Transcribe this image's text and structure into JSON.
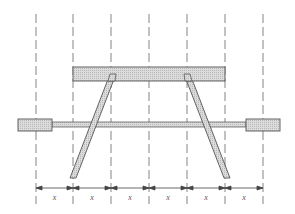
{
  "diagram": {
    "type": "mechanical-linkage",
    "colors": {
      "line": "#555555",
      "dashed": "#777777",
      "hatch_fill": "#d6d6d6",
      "background": "#ffffff"
    },
    "grid_lines_x": [
      36,
      73,
      111,
      149,
      187,
      225,
      263
    ],
    "dimension_label": "x",
    "dimensions": [
      {
        "label": "x"
      },
      {
        "label": "x"
      },
      {
        "label": "x"
      },
      {
        "label": "x"
      },
      {
        "label": "x"
      },
      {
        "label": "x"
      }
    ],
    "components": {
      "top_beam": "hatched horizontal beam",
      "left_leg": "hatched inclined link",
      "right_leg": "hatched inclined link",
      "rod": "horizontal rod",
      "left_block": "hatched slider block",
      "right_block": "hatched slider block"
    }
  }
}
